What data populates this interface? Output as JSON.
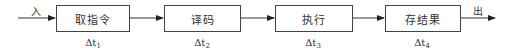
{
  "diagram": {
    "type": "pipeline-flow",
    "input_label": "入",
    "output_label": "出",
    "stages": [
      {
        "label": "取指令",
        "time_symbol": "Δt",
        "time_sub": "1"
      },
      {
        "label": "译码",
        "time_symbol": "Δt",
        "time_sub": "2"
      },
      {
        "label": "执行",
        "time_symbol": "Δt",
        "time_sub": "3"
      },
      {
        "label": "存结果",
        "time_symbol": "Δt",
        "time_sub": "4"
      }
    ],
    "colors": {
      "stroke": "#444444",
      "text": "#333333",
      "background": "#ffffff"
    }
  }
}
